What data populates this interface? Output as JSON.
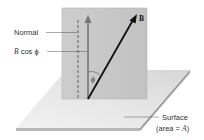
{
  "diagram": {
    "labels": {
      "normal": "Normal",
      "b_cos_phi_b": "B",
      "b_cos_phi_rest": " cos ",
      "b_cos_phi_phi": "ϕ",
      "vector_b": "B",
      "angle": "ϕ",
      "surface": "Surface",
      "area_prefix": "(area = ",
      "area_var": "A",
      "area_suffix": ")"
    },
    "colors": {
      "panel": "#c9c9c9",
      "panel_edge": "#b5b5b5",
      "plate_top": "#ececec",
      "plate_edge": "#a9a9a9",
      "normal_arrow": "#777777",
      "b_arrow": "#111111",
      "leader": "#555555",
      "text": "#333333"
    }
  }
}
